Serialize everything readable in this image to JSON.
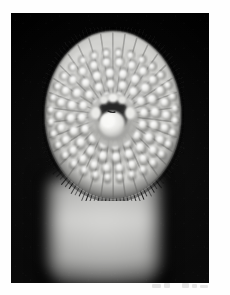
{
  "page": {
    "background_color": "#fefefe",
    "ghost_marks_label": "faint illegible ghost marks"
  },
  "photo": {
    "caption_alt": "Black and white macro photograph of a lamprey oral disc (sucking mouth) viewed head-on",
    "background_color": "#050505",
    "frame": {
      "left": 11,
      "top": 13,
      "width": 198,
      "height": 270
    }
  },
  "subject": {
    "name": "lamprey-oral-disc",
    "parts": [
      {
        "name": "oral-disc",
        "description": "circular sucker disc"
      },
      {
        "name": "tooth-rows",
        "description": "radial rows of bright conical horny teeth"
      },
      {
        "name": "mouth-opening",
        "description": "dark central oral aperture"
      },
      {
        "name": "tongue-piston",
        "description": "pale lingual piston inside the mouth"
      },
      {
        "name": "fimbriae-fringe",
        "description": "dark fringe of papillae at disc margin"
      },
      {
        "name": "body-trunk",
        "description": "blurred pale body below the disc"
      }
    ]
  },
  "tones": {
    "black": "#050505",
    "dark_gray": "#2b2b2b",
    "mid_gray": "#8e8e8c",
    "light_gray": "#cfcfcd",
    "highlight": "#f4f4f2",
    "white": "#ffffff"
  },
  "disc_geometry": {
    "center_x": 71,
    "center_y": 88,
    "outer_radius_x": 70,
    "outer_radius_y": 86,
    "tooth_rings": [
      {
        "ring": 1,
        "radius": 20,
        "count": 10,
        "tooth_size": 4.6
      },
      {
        "ring": 2,
        "radius": 31,
        "count": 16,
        "tooth_size": 5.4
      },
      {
        "ring": 3,
        "radius": 42,
        "count": 20,
        "tooth_size": 5.6
      },
      {
        "ring": 4,
        "radius": 53,
        "count": 26,
        "tooth_size": 5.0
      },
      {
        "ring": 5,
        "radius": 62,
        "count": 32,
        "tooth_size": 4.0
      }
    ],
    "fringe_lines": 120
  }
}
